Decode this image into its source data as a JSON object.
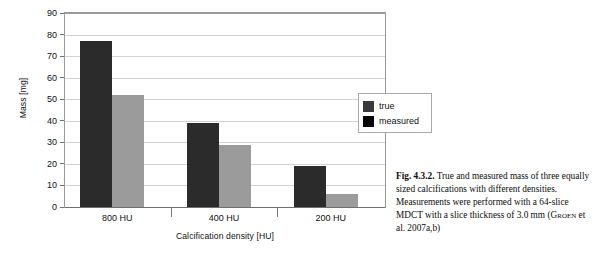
{
  "chart_data": {
    "type": "bar",
    "title": "",
    "xlabel": "Calcification density [HU]",
    "ylabel": "Mass [mg]",
    "categories": [
      "800 HU",
      "400 HU",
      "200 HU"
    ],
    "series": [
      {
        "name": "true",
        "values": [
          77,
          39,
          19
        ],
        "color": "#2b2b2b"
      },
      {
        "name": "measured",
        "values": [
          52,
          29,
          6
        ],
        "color": "#9b9b9b"
      }
    ],
    "ylim": [
      0,
      90
    ],
    "ytick_step": 10,
    "yticks": [
      "90",
      "80",
      "70",
      "60",
      "50",
      "40",
      "30",
      "20",
      "10",
      "0"
    ],
    "grid": true,
    "legend_position": "right"
  },
  "legend": {
    "entries": [
      {
        "label": "true",
        "swatch_color": "#3a3a3a"
      },
      {
        "label": "measured",
        "swatch_color": "#050505"
      }
    ]
  },
  "caption": {
    "label": "Fig. 4.3.2.",
    "body_before_citation": " True and measured mass of three equally sized calcifications with different densities. Measurements were performed with a 64-slice MDCT with a slice thickness of 3.0 mm (",
    "citation_name": "Groen",
    "body_after_citation": " et al. 2007a,b)"
  }
}
